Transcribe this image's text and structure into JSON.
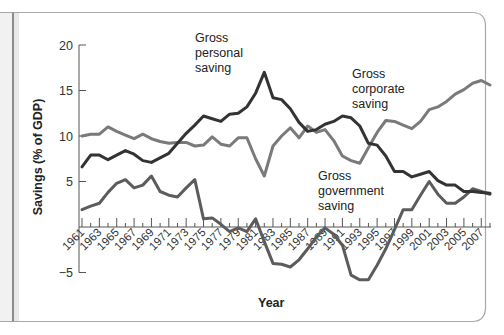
{
  "chart_data": {
    "type": "line",
    "title": "",
    "xlabel": "Year",
    "ylabel": "Savings (% of GDP)",
    "ylim": [
      -5,
      20
    ],
    "xlim": [
      1961,
      2008
    ],
    "grid": false,
    "legend_position": "inline labels",
    "y_ticks": [
      "20",
      "15",
      "10",
      "5",
      "−5"
    ],
    "y_tick_values": [
      20,
      15,
      10,
      5,
      -5
    ],
    "x_tick_labels": [
      "1961",
      "1963",
      "1965",
      "1967",
      "1969",
      "1971",
      "1973",
      "1975",
      "1977",
      "1979",
      "1981",
      "1983",
      "1985",
      "1987",
      "1989",
      "1991",
      "1993",
      "1995",
      "1997",
      "1999",
      "2001",
      "2003",
      "2005",
      "2007"
    ],
    "x": [
      1961,
      1962,
      1963,
      1964,
      1965,
      1966,
      1967,
      1968,
      1969,
      1970,
      1971,
      1972,
      1973,
      1974,
      1975,
      1976,
      1977,
      1978,
      1979,
      1980,
      1981,
      1982,
      1983,
      1984,
      1985,
      1986,
      1987,
      1988,
      1989,
      1990,
      1991,
      1992,
      1993,
      1994,
      1995,
      1996,
      1997,
      1998,
      1999,
      2000,
      2001,
      2002,
      2003,
      2004,
      2005,
      2006,
      2007,
      2008
    ],
    "series": [
      {
        "name": "Gross personal saving",
        "label_lines": [
          "Gross",
          "personal",
          "saving"
        ],
        "color": "#333333",
        "values": [
          6.6,
          7.9,
          7.9,
          7.4,
          7.9,
          8.4,
          8.0,
          7.3,
          7.1,
          7.6,
          8.1,
          9.2,
          10.3,
          11.2,
          12.2,
          11.9,
          11.6,
          12.4,
          12.5,
          13.2,
          14.7,
          17.0,
          14.2,
          14.0,
          13.0,
          11.5,
          10.5,
          10.7,
          11.3,
          11.6,
          12.2,
          12.0,
          11.1,
          9.2,
          9.0,
          7.8,
          6.1,
          6.1,
          5.5,
          5.8,
          6.1,
          5.1,
          4.6,
          4.6,
          3.9,
          3.9,
          3.8,
          3.7
        ]
      },
      {
        "name": "Gross corporate saving",
        "label_lines": [
          "Gross",
          "corporate",
          "saving"
        ],
        "color": "#7a7a7a",
        "values": [
          10.0,
          10.2,
          10.2,
          11.0,
          10.5,
          10.1,
          9.7,
          10.2,
          9.7,
          9.4,
          9.2,
          9.3,
          9.3,
          8.9,
          9.0,
          9.9,
          9.1,
          8.9,
          9.8,
          9.8,
          7.5,
          5.6,
          8.9,
          10.0,
          10.9,
          9.8,
          11.1,
          10.4,
          10.7,
          9.5,
          7.8,
          7.3,
          7.0,
          8.7,
          10.4,
          11.7,
          11.6,
          11.2,
          10.8,
          11.6,
          12.9,
          13.2,
          13.8,
          14.6,
          15.1,
          15.8,
          16.1,
          15.6
        ]
      },
      {
        "name": "Gross government saving",
        "label_lines": [
          "Gross",
          "government",
          "saving"
        ],
        "color": "#5c5c5c",
        "values": [
          1.9,
          2.3,
          2.6,
          3.8,
          4.8,
          5.2,
          4.3,
          4.6,
          5.6,
          3.9,
          3.5,
          3.3,
          4.3,
          5.2,
          0.9,
          1.0,
          0.3,
          -0.5,
          -0.1,
          -0.5,
          0.9,
          -1.6,
          -4.0,
          -4.1,
          -4.4,
          -3.6,
          -2.4,
          -1.1,
          -0.1,
          -0.8,
          -2.0,
          -5.3,
          -5.8,
          -5.8,
          -4.2,
          -2.4,
          -0.3,
          1.9,
          1.9,
          3.5,
          5.0,
          3.6,
          2.6,
          2.6,
          3.3,
          4.2,
          3.9,
          3.6
        ]
      }
    ]
  }
}
